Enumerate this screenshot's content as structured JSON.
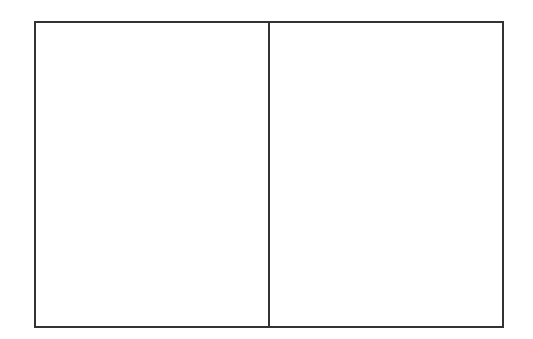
{
  "diagram": {
    "type": "two-panel-frame",
    "line_color": "#333333",
    "background_color": "#ffffff",
    "panels": [
      {
        "id": "left",
        "label": ""
      },
      {
        "id": "right",
        "label": ""
      }
    ]
  }
}
